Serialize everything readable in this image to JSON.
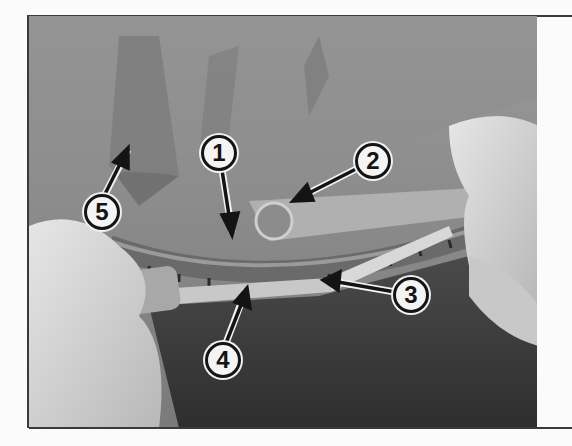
{
  "figure": {
    "callouts": [
      {
        "label": "1",
        "x": 219,
        "y": 153
      },
      {
        "label": "2",
        "x": 373,
        "y": 161
      },
      {
        "label": "3",
        "x": 411,
        "y": 295
      },
      {
        "label": "4",
        "x": 223,
        "y": 360
      },
      {
        "label": "5",
        "x": 102,
        "y": 212
      }
    ]
  },
  "colors": {
    "page_background": "#fbfbfb",
    "frame": "#3a3a3a",
    "callout_fill": "#f4f4f4",
    "callout_stroke": "#141414"
  }
}
